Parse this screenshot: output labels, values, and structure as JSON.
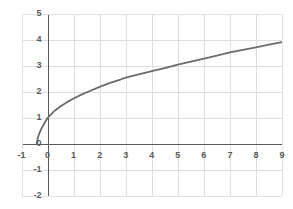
{
  "chart_data": {
    "type": "line",
    "title": "",
    "subtitle": "",
    "xlabel": "",
    "ylabel": "",
    "xlim": [
      -1,
      9
    ],
    "ylim": [
      -2,
      5
    ],
    "grid": true,
    "legend": false,
    "legend_position": "none",
    "x_ticks": [
      -1,
      0,
      1,
      2,
      3,
      4,
      5,
      6,
      7,
      8,
      9
    ],
    "x_tick_labels": [
      "-1",
      "0",
      "1",
      "2",
      "3",
      "4",
      "5",
      "6",
      "7",
      "8",
      "9"
    ],
    "y_ticks": [
      -2,
      -1,
      0,
      1,
      2,
      3,
      4,
      5
    ],
    "y_tick_labels": [
      "-2",
      "-1",
      "0",
      "1",
      "2",
      "3",
      "4",
      "5"
    ],
    "series": [
      {
        "name": "curve",
        "color": "#6b6b6b",
        "line_width": 1.8,
        "x": [
          -0.42,
          -0.4,
          -0.36,
          -0.3,
          -0.22,
          -0.12,
          0.0,
          0.15,
          0.3,
          0.5,
          0.75,
          1.0,
          1.3,
          1.6,
          2.0,
          2.4,
          2.8,
          3.0,
          3.5,
          4.0,
          4.5,
          5.0,
          5.5,
          6.0,
          6.5,
          7.0,
          7.5,
          8.0,
          8.5,
          9.0
        ],
        "y": [
          0.0,
          0.12,
          0.28,
          0.45,
          0.62,
          0.8,
          1.0,
          1.16,
          1.3,
          1.45,
          1.61,
          1.75,
          1.9,
          2.03,
          2.2,
          2.35,
          2.48,
          2.55,
          2.68,
          2.8,
          2.92,
          3.05,
          3.17,
          3.28,
          3.4,
          3.52,
          3.62,
          3.72,
          3.82,
          3.92
        ]
      }
    ],
    "axis_color": "#595959",
    "grid_color": "#dedede",
    "plot_background": "#ffffff",
    "border_color": "#e3e3e3"
  },
  "axes": {
    "x_axis_name": "x-axis",
    "y_axis_name": "y-axis"
  }
}
